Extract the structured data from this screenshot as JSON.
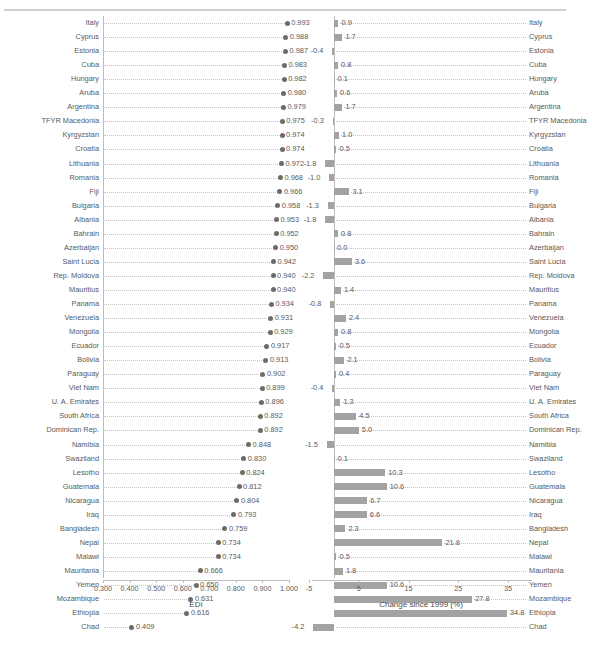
{
  "figure": {
    "top_partial_text": "",
    "left_axis_title": "EDI",
    "right_axis_title": "Change since 1999 (%)",
    "colors": {
      "dot": "#6b6b6b",
      "bar": "#a3a3a3",
      "axis": "#bdbdbd",
      "text": "#595959",
      "gridline": "#c5c5c5"
    }
  },
  "chart_data": [
    {
      "type": "scatter",
      "id": "edi-dotplot",
      "title": "",
      "xlabel": "EDI",
      "ylabel": "",
      "xlim": [
        0.3,
        1.0
      ],
      "xticks": [
        0.3,
        0.4,
        0.5,
        0.6,
        0.7,
        0.8,
        0.9,
        1.0
      ],
      "xticklabels": [
        "0.300",
        "0.400",
        "0.500",
        "0.600",
        "0.700",
        "0.800",
        "0.900",
        "1.000"
      ],
      "grid": "dotted-horizontal",
      "legend": "none",
      "categories": [
        "Italy",
        "Cyprus",
        "Estonia",
        "Cuba",
        "Hungary",
        "Aruba",
        "Argentina",
        "TFYR Macedonia",
        "Kyrgyzstan",
        "Croatia",
        "Lithuania",
        "Romania",
        "Fiji",
        "Bulgaria",
        "Albania",
        "Bahrain",
        "Azerbaijan",
        "Saint Lucia",
        "Rep. Moldova",
        "Mauritius",
        "Panama",
        "Venezuela",
        "Mongolia",
        "Ecuador",
        "Bolivia",
        "Paraguay",
        "Viet Nam",
        "U. A. Emirates",
        "South Africa",
        "Dominican Rep.",
        "Namibia",
        "Swaziland",
        "Lesotho",
        "Guatemala",
        "Nicaragua",
        "Iraq",
        "Bangladesh",
        "Nepal",
        "Malawi",
        "Mauritania",
        "Yemen",
        "Mozambique",
        "Ethiopia",
        "Chad"
      ],
      "values": [
        0.993,
        0.988,
        0.987,
        0.983,
        0.982,
        0.98,
        0.979,
        0.975,
        0.974,
        0.974,
        0.972,
        0.968,
        0.966,
        0.958,
        0.953,
        0.952,
        0.95,
        0.942,
        0.94,
        0.94,
        0.934,
        0.931,
        0.929,
        0.917,
        0.913,
        0.902,
        0.899,
        0.896,
        0.892,
        0.892,
        0.848,
        0.83,
        0.824,
        0.812,
        0.804,
        0.793,
        0.759,
        0.734,
        0.734,
        0.666,
        0.65,
        0.631,
        0.616,
        0.409
      ],
      "labels": [
        "0.993",
        "0.988",
        "0.987",
        "0.983",
        "0.982",
        "0.980",
        "0.979",
        "0.975",
        "0.974",
        "0.974",
        "0.972",
        "0.968",
        "0.966",
        "0.958",
        "0.953",
        "0.952",
        "0.950",
        "0.942",
        "0.940",
        "0.940",
        "0.934",
        "0.931",
        "0.929",
        "0.917",
        "0.913",
        "0.902",
        "0.899",
        "0.896",
        "0.892",
        "0.892",
        "0.848",
        "0.830",
        "0.824",
        "0.812",
        "0.804",
        "0.793",
        "0.759",
        "0.734",
        "0.734",
        "0.666",
        "0.650",
        "0.631",
        "0.616",
        "0.409"
      ]
    },
    {
      "type": "bar",
      "id": "change-since-1999",
      "title": "",
      "xlabel": "Change since 1999 (%)",
      "ylabel": "",
      "orientation": "horizontal",
      "xlim": [
        -5,
        39
      ],
      "xticks": [
        -5,
        5,
        15,
        25,
        35
      ],
      "xticklabels": [
        "-5",
        "5",
        "15",
        "25",
        "35"
      ],
      "grid": "dotted-horizontal",
      "legend": "none",
      "categories": [
        "Italy",
        "Cyprus",
        "Estonia",
        "Cuba",
        "Hungary",
        "Aruba",
        "Argentina",
        "TFYR Macedonia",
        "Kyrgyzstan",
        "Croatia",
        "Lithuania",
        "Romania",
        "Fiji",
        "Bulgaria",
        "Albania",
        "Bahrain",
        "Azerbaijan",
        "Saint Lucia",
        "Rep. Moldova",
        "Mauritius",
        "Panama",
        "Venezuela",
        "Mongolia",
        "Ecuador",
        "Bolivia",
        "Paraguay",
        "Viet Nam",
        "U. A. Emirates",
        "South Africa",
        "Dominican Rep.",
        "Namibia",
        "Swaziland",
        "Lesotho",
        "Guatemala",
        "Nicaragua",
        "Iraq",
        "Bangladesh",
        "Nepal",
        "Malawi",
        "Mauritania",
        "Yemen",
        "Mozambique",
        "Ethiopia",
        "Chad"
      ],
      "values": [
        0.9,
        1.7,
        -0.4,
        0.8,
        0.1,
        0.6,
        1.7,
        -0.3,
        1.0,
        0.5,
        -1.8,
        -1.0,
        3.1,
        -1.3,
        -1.8,
        0.8,
        0.0,
        3.6,
        -2.2,
        1.4,
        -0.8,
        2.4,
        0.8,
        0.5,
        2.1,
        0.4,
        -0.4,
        1.3,
        4.5,
        5.0,
        -1.5,
        0.1,
        10.3,
        10.6,
        6.7,
        6.6,
        2.3,
        21.8,
        0.5,
        1.8,
        10.6,
        27.8,
        34.8,
        -4.2
      ],
      "labels": [
        "0.9",
        "1.7",
        "-0.4",
        "0.8",
        "0.1",
        "0.6",
        "1.7",
        "-0.3",
        "1.0",
        "0.5",
        "-1.8",
        "-1.0",
        "3.1",
        "-1.3",
        "-1.8",
        "0.8",
        "0.0",
        "3.6",
        "-2.2",
        "1.4",
        "-0.8",
        "2.4",
        "0.8",
        "0.5",
        "2.1",
        "0.4",
        "-0.4",
        "1.3",
        "4.5",
        "5.0",
        "-1.5",
        "0.1",
        "10.3",
        "10.6",
        "6.7",
        "6.6",
        "2.3",
        "21.8",
        "0.5",
        "1.8",
        "10.6",
        "27.8",
        "34.8",
        "-4.2"
      ]
    }
  ]
}
